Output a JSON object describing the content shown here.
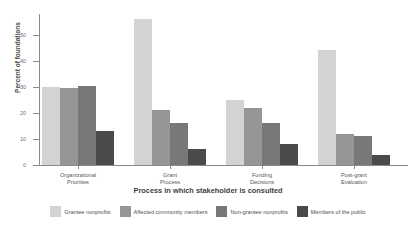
{
  "chart_data": {
    "type": "bar",
    "title": "",
    "xlabel": "Process in which stakeholder is consulted",
    "ylabel": "Percent of foundations",
    "ylim": [
      0,
      58
    ],
    "yticks": [
      0,
      10,
      20,
      30,
      40,
      50
    ],
    "ytick_labels": [
      "0",
      "10",
      "20",
      "30",
      "40",
      "50"
    ],
    "grid": false,
    "legend_position": "bottom",
    "categories": [
      "Organizational\nPriorities",
      "Grant\nProcess",
      "Funding\nDecisions",
      "Post-grant\nEvaluation"
    ],
    "series": [
      {
        "name": "Grantee nonprofits",
        "color": "#d3d3d3",
        "values": [
          30,
          56,
          25,
          44
        ]
      },
      {
        "name": "Affected community members",
        "color": "#969696",
        "values": [
          29.5,
          21,
          22,
          12
        ]
      },
      {
        "name": "Non-grantee nonprofits",
        "color": "#787878",
        "values": [
          30.5,
          16,
          16,
          11
        ]
      },
      {
        "name": "Members of the public",
        "color": "#4a4a4a",
        "values": [
          13,
          6,
          8,
          4
        ]
      }
    ]
  },
  "axes": {
    "y_title": "Percent of foundations",
    "x_title": "Process in which stakeholder is consulted"
  },
  "colors": {
    "axis": "#8a8a8a",
    "tick_text": "#6d6d6d",
    "label_text": "#585858",
    "title_text": "#3f3f3f",
    "background": "#ffffff"
  }
}
